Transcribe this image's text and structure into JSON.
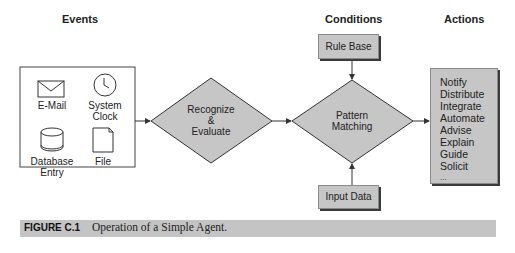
{
  "headers": {
    "events": "Events",
    "conditions": "Conditions",
    "actions": "Actions"
  },
  "events": {
    "items": [
      {
        "label_line1": "E-Mail",
        "label_line2": "",
        "icon": "envelope-icon"
      },
      {
        "label_line1": "System",
        "label_line2": "Clock",
        "icon": "clock-icon"
      },
      {
        "label_line1": "Database",
        "label_line2": "Entry",
        "icon": "database-icon"
      },
      {
        "label_line1": "File",
        "label_line2": "",
        "icon": "file-icon"
      }
    ]
  },
  "process": {
    "recognize": {
      "line1": "Recognize",
      "line2": "&",
      "line3": "Evaluate"
    },
    "pattern": {
      "line1": "Pattern",
      "line2": "Matching"
    }
  },
  "conditions": {
    "rule_base": "Rule Base",
    "input_data": "Input Data"
  },
  "actions": {
    "items": [
      "Notify",
      "Distribute",
      "Integrate",
      "Automate",
      "Advise",
      "Explain",
      "Guide",
      "Solicit",
      "..."
    ]
  },
  "caption": {
    "figure_label": "FIGURE C.1",
    "text": "Operation of a Simple Agent."
  },
  "colors": {
    "shape_fill": "#c6c6c6",
    "caption_bar": "#c4c4c4",
    "line": "#333333"
  }
}
